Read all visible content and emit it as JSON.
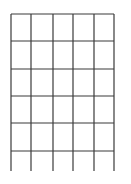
{
  "grid": {
    "line_color": "#3a3a3a",
    "line_width": 1.2,
    "vertical_x": [
      11,
      31,
      53,
      73,
      94,
      114
    ],
    "horizontal_y": [
      14,
      41,
      69,
      96,
      123,
      151
    ],
    "top_y": 14,
    "bottom_y": 171,
    "left_x": 11,
    "right_x": 114,
    "columns": 5,
    "rows": 5
  }
}
